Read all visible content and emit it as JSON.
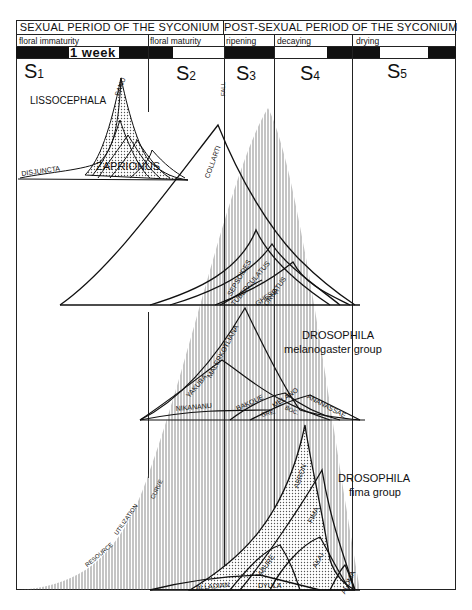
{
  "header": {
    "sexual_period": "SEXUAL PERIOD OF THE SYCONIUM",
    "post_sexual_period": "POST-SEXUAL PERIOD OF THE SYCONIUM",
    "phases": [
      "floral immaturity",
      "floral maturity",
      "ripening",
      "decaying",
      "drying"
    ],
    "timescale_label": "1 week"
  },
  "stages": [
    {
      "letter": "S",
      "num": "1"
    },
    {
      "letter": "S",
      "num": "2"
    },
    {
      "letter": "S",
      "num": "3"
    },
    {
      "letter": "S",
      "num": "4"
    },
    {
      "letter": "S",
      "num": "5"
    }
  ],
  "annotations": {
    "fall": "FALL",
    "resource_curve": [
      "RESOURCE",
      "UTILIZATION",
      "CURVE"
    ]
  },
  "groups": {
    "lissocephala": {
      "title": "LISSOCEPHALA",
      "species": [
        "SANU",
        "DISJUNCTA"
      ]
    },
    "zaprionus": {
      "title": "ZAPRIONUS",
      "species": [
        "COLLARTI",
        "SEPSOIDES",
        "TUBERCULATUS",
        "GHESQ.",
        "ORNATUS"
      ]
    },
    "melanogaster": {
      "title": "DROSOPHILA",
      "subtitle": "melanogaster group",
      "species": [
        "MALERKOTLIANA",
        "YAKUBA",
        "NIKANANU",
        "BAKOUE",
        "MELANO",
        "GRE.",
        "BOC.",
        "ANANASSAE"
      ]
    },
    "fima": {
      "title": "DROSOPHILA",
      "subtitle": "fima group",
      "species": [
        "ABRON",
        "FIMA",
        "AKAI",
        "ABURE",
        "ALOMA",
        "ALLADIAN",
        "DYULA"
      ]
    }
  },
  "colors": {
    "ink": "#111111",
    "paper": "#ffffff",
    "stipple": "#c8c8c8"
  }
}
